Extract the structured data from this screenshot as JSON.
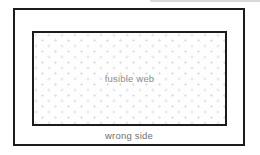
{
  "diagram": {
    "fusible_web_label": "fusible web",
    "wrong_side_label": "wrong side"
  },
  "colors": {
    "border": "#1c1c1c",
    "background": "#ffffff",
    "dot": "#e3e3e3",
    "label_text": "#8d8d8d",
    "wrong_side_text": "#6f6f6f"
  }
}
